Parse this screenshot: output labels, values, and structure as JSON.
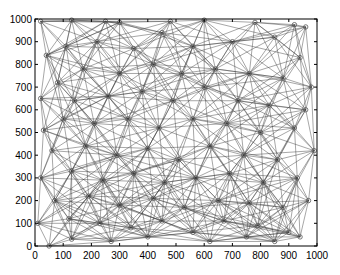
{
  "chart_data": {
    "type": "scatter",
    "subtype": "network-graph",
    "title": "",
    "xlabel": "",
    "ylabel": "",
    "xlim": [
      0,
      1000
    ],
    "ylim": [
      0,
      1000
    ],
    "xticks": [
      0,
      100,
      200,
      300,
      400,
      500,
      600,
      700,
      800,
      900,
      1000
    ],
    "yticks": [
      0,
      100,
      200,
      300,
      400,
      500,
      600,
      700,
      800,
      900,
      1000
    ],
    "grid": false,
    "legend": null,
    "edge_rule": "connect nodes within radius",
    "connection_radius": 300,
    "colors": {
      "edge": "#3a3a3a",
      "node": "#555555",
      "axis": "#000000",
      "background": "#ffffff"
    },
    "nodes": [
      [
        20,
        990
      ],
      [
        130,
        995
      ],
      [
        250,
        990
      ],
      [
        300,
        985
      ],
      [
        480,
        990
      ],
      [
        600,
        995
      ],
      [
        780,
        985
      ],
      [
        920,
        975
      ],
      [
        960,
        965
      ],
      [
        40,
        840
      ],
      [
        110,
        880
      ],
      [
        220,
        900
      ],
      [
        350,
        870
      ],
      [
        450,
        940
      ],
      [
        560,
        880
      ],
      [
        700,
        900
      ],
      [
        850,
        920
      ],
      [
        940,
        830
      ],
      [
        80,
        720
      ],
      [
        170,
        780
      ],
      [
        300,
        760
      ],
      [
        420,
        800
      ],
      [
        520,
        760
      ],
      [
        640,
        780
      ],
      [
        760,
        760
      ],
      [
        880,
        740
      ],
      [
        980,
        700
      ],
      [
        20,
        650
      ],
      [
        140,
        640
      ],
      [
        260,
        660
      ],
      [
        380,
        680
      ],
      [
        490,
        640
      ],
      [
        600,
        700
      ],
      [
        720,
        640
      ],
      [
        830,
        620
      ],
      [
        960,
        600
      ],
      [
        30,
        510
      ],
      [
        100,
        560
      ],
      [
        210,
        540
      ],
      [
        330,
        560
      ],
      [
        440,
        520
      ],
      [
        560,
        560
      ],
      [
        680,
        540
      ],
      [
        800,
        500
      ],
      [
        920,
        520
      ],
      [
        60,
        420
      ],
      [
        180,
        440
      ],
      [
        290,
        400
      ],
      [
        400,
        430
      ],
      [
        510,
        380
      ],
      [
        620,
        440
      ],
      [
        740,
        400
      ],
      [
        860,
        380
      ],
      [
        990,
        420
      ],
      [
        20,
        300
      ],
      [
        130,
        330
      ],
      [
        240,
        290
      ],
      [
        350,
        320
      ],
      [
        460,
        280
      ],
      [
        570,
        300
      ],
      [
        690,
        320
      ],
      [
        810,
        280
      ],
      [
        930,
        300
      ],
      [
        70,
        200
      ],
      [
        190,
        220
      ],
      [
        300,
        180
      ],
      [
        420,
        210
      ],
      [
        530,
        170
      ],
      [
        650,
        200
      ],
      [
        760,
        190
      ],
      [
        880,
        170
      ],
      [
        970,
        200
      ],
      [
        10,
        100
      ],
      [
        120,
        120
      ],
      [
        230,
        100
      ],
      [
        340,
        80
      ],
      [
        450,
        110
      ],
      [
        560,
        60
      ],
      [
        670,
        110
      ],
      [
        790,
        90
      ],
      [
        900,
        60
      ],
      [
        50,
        0
      ],
      [
        130,
        30
      ],
      [
        270,
        20
      ],
      [
        400,
        40
      ],
      [
        620,
        20
      ],
      [
        750,
        40
      ],
      [
        850,
        20
      ],
      [
        940,
        40
      ]
    ]
  }
}
